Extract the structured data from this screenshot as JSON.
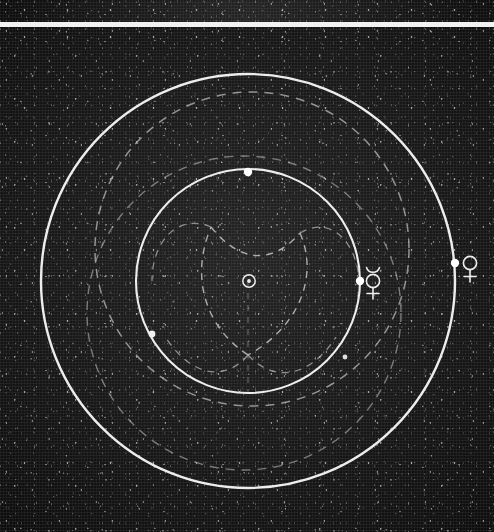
{
  "figure": {
    "kind": "astronomical-orbit-diagram",
    "background": "star-field halftone plate",
    "colors": {
      "plate_dark": "#1a1a1a",
      "plate_deep": "#0d0d0d",
      "line_solid": "#e6e6e6",
      "line_dashed": "#b9b9b9",
      "marker": "#ffffff",
      "gap_white": "#f2f2f2"
    },
    "panels": [
      {
        "name": "top-strip",
        "y": 0,
        "height": 22,
        "note": "cropped edge of adjacent plate"
      },
      {
        "name": "separator",
        "y": 22,
        "height": 5
      },
      {
        "name": "main-plate",
        "y": 27,
        "height": 505
      }
    ]
  },
  "diagram": {
    "center": {
      "x": 248,
      "y": 254
    },
    "orbits": [
      {
        "id": "venus-orbit",
        "style": "solid",
        "radius": 207,
        "cx": 248,
        "cy": 254,
        "label": "Venus orbit"
      },
      {
        "id": "mercury-orbit",
        "style": "solid",
        "radius": 112,
        "cx": 248,
        "cy": 254,
        "label": "Mercury orbit"
      },
      {
        "id": "upper-deferent",
        "style": "dashed",
        "radius": 157,
        "cx": 252,
        "cy": 222,
        "label": "upper dashed construction circle"
      },
      {
        "id": "lower-deferent",
        "style": "dashed",
        "radius": 157,
        "cx": 244,
        "cy": 286,
        "label": "lower dashed construction circle"
      }
    ],
    "rosette": {
      "id": "mercury-rosette",
      "style": "dashed",
      "type": "three-cusped hypocycloid (deltoid)",
      "cusps": 3,
      "cusp_points": [
        {
          "x": 248,
          "y": 328,
          "name": "cusp-bottom"
        },
        {
          "x": 211,
          "y": 200,
          "name": "cusp-upper-left"
        },
        {
          "x": 300,
          "y": 206,
          "name": "cusp-upper-right"
        }
      ],
      "circumscribed_radius": 95
    },
    "symbols": [
      {
        "id": "sun-symbol",
        "glyph": "☉",
        "name": "Sun",
        "x": 249,
        "y": 254,
        "size": 15
      },
      {
        "id": "mercury-symbol",
        "glyph": "☿",
        "name": "Mercury",
        "x": 373,
        "y": 253,
        "size": 22
      },
      {
        "id": "venus-symbol",
        "glyph": "♀",
        "name": "Venus",
        "x": 470,
        "y": 236,
        "size": 22
      }
    ],
    "markers": [
      {
        "id": "marker-mercury-body",
        "x": 360,
        "y": 254,
        "r": 4.2,
        "on": "mercury-orbit"
      },
      {
        "id": "marker-venus-body",
        "x": 455,
        "y": 236,
        "r": 4.2,
        "on": "venus-orbit"
      },
      {
        "id": "marker-mercury-top",
        "x": 248,
        "y": 145,
        "r": 4.2,
        "on": "mercury-orbit"
      },
      {
        "id": "marker-mercury-left",
        "x": 152,
        "y": 307,
        "r": 3.4,
        "on": "mercury-orbit"
      },
      {
        "id": "marker-mercury-br",
        "x": 345,
        "y": 330,
        "r": 2.6,
        "on": "mercury-orbit"
      }
    ]
  }
}
